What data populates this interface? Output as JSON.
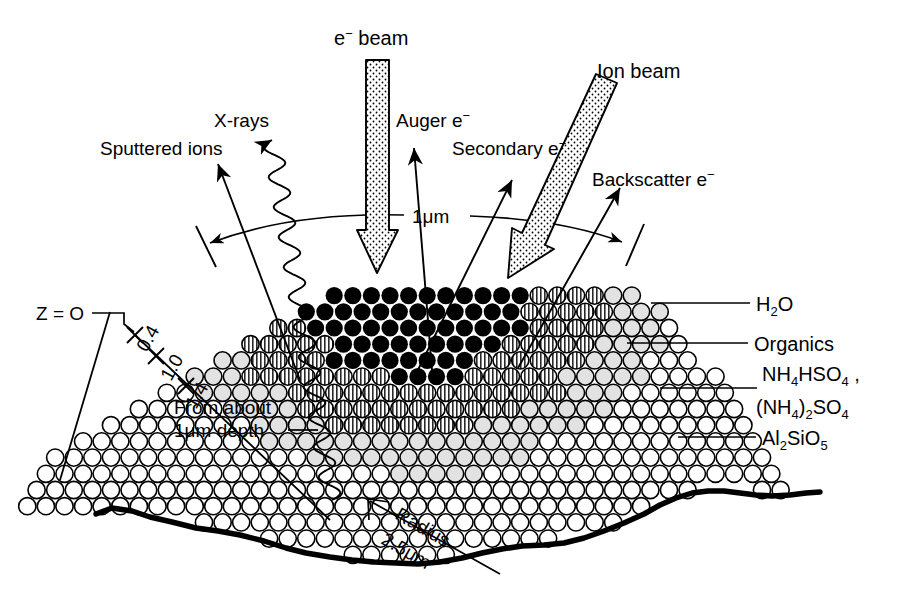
{
  "figure": {
    "title_text": "Schematic of electron and ion beam interaction volumes in an atmospheric particle",
    "beams": [
      {
        "id": "e-beam",
        "label": "e",
        "superscript": "−",
        "label_tail": " beam",
        "full": "e− beam",
        "style": "stippled-arrow",
        "direction": "vertical-down"
      },
      {
        "id": "ion-beam",
        "label": "Ion beam",
        "full": "Ion beam",
        "style": "stippled-arrow",
        "direction": "diagonal-down-left"
      }
    ],
    "emission_labels": [
      {
        "id": "sputtered-ions",
        "text": "Sputtered ions"
      },
      {
        "id": "x-rays",
        "text": "X-rays",
        "line_style": "wavy"
      },
      {
        "id": "auger-electrons",
        "text": "Auger e",
        "superscript": "−"
      },
      {
        "id": "secondary-electrons",
        "text": "Secondary e",
        "superscript": "−"
      },
      {
        "id": "backscatter-electrons",
        "text": "Backscatter e",
        "superscript": "−"
      }
    ],
    "scale_arc": {
      "label": "1",
      "unit": "μm",
      "full": "1μm"
    },
    "origin_label": {
      "text": "Z = O"
    },
    "depth_ticks": [
      {
        "value": "0.4"
      },
      {
        "value": "1.0"
      },
      {
        "value": "1.4"
      }
    ],
    "depth_note": {
      "line1": "From about",
      "line2_num": "1",
      "line2_unit": "μm",
      "line2_tail": " depth",
      "full": "From about 1μm depth"
    },
    "radius_note": {
      "line1": "Radius",
      "line2_num": "2.5",
      "line2_unit": "μm",
      "full": "Radius 2.5μm"
    },
    "composition_labels": [
      {
        "id": "water",
        "formula": "H",
        "sub1": "2",
        "tail": "O",
        "full": "H2O"
      },
      {
        "id": "organics",
        "formula": "Organics",
        "full": "Organics"
      },
      {
        "id": "ammonium-bisulfate",
        "full": "NH4HSO4 ,",
        "parts": [
          {
            "t": "NH",
            "k": "n"
          },
          {
            "t": "4",
            "k": "s"
          },
          {
            "t": "HSO",
            "k": "n"
          },
          {
            "t": "4",
            "k": "s"
          },
          {
            "t": " ,",
            "k": "n"
          }
        ]
      },
      {
        "id": "ammonium-sulfate",
        "full": "(NH4)2SO4",
        "parts": [
          {
            "t": "(NH",
            "k": "n"
          },
          {
            "t": "4",
            "k": "s"
          },
          {
            "t": ")",
            "k": "n"
          },
          {
            "t": "2",
            "k": "s"
          },
          {
            "t": "SO",
            "k": "n"
          },
          {
            "t": "4",
            "k": "s"
          }
        ]
      },
      {
        "id": "aluminosilicate",
        "full": "Al2SiO5",
        "parts": [
          {
            "t": "Al",
            "k": "n"
          },
          {
            "t": "2",
            "k": "s"
          },
          {
            "t": "SiO",
            "k": "n"
          },
          {
            "t": "5",
            "k": "s"
          }
        ]
      }
    ],
    "shading_bands": [
      {
        "id": "band-open",
        "name": "open-circles",
        "fill": "#ffffff"
      },
      {
        "id": "band-light",
        "name": "light-gray-circles",
        "fill": "#e2e2e2"
      },
      {
        "id": "band-hatch",
        "name": "hatched-circles",
        "fill": "#9a9a9a"
      },
      {
        "id": "band-solid",
        "name": "solid-black-circles",
        "fill": "#000000"
      }
    ],
    "colors": {
      "ink": "#000000",
      "paper": "#ffffff",
      "light_gray": "#e2e2e2",
      "mid_gray": "#9a9a9a"
    }
  }
}
